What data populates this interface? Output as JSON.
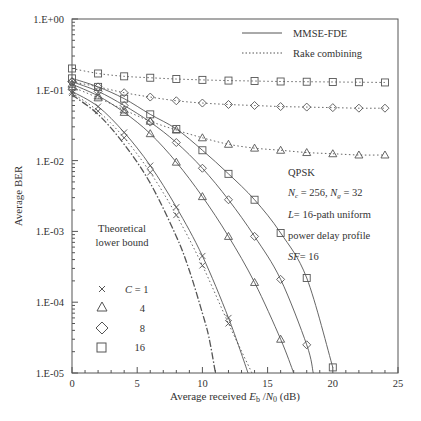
{
  "chart_data": {
    "type": "line",
    "title": "",
    "xlabel": "Average received Eb/N0 (dB)",
    "ylabel": "Average BER",
    "xlim": [
      0,
      25
    ],
    "ylim": [
      1e-05,
      1
    ],
    "yscale": "log",
    "x_ticks": [
      0,
      5,
      10,
      15,
      20,
      25
    ],
    "y_ticks": [
      "1.E+00",
      "1.E-01",
      "1.E-02",
      "1.E-03",
      "1.E-04",
      "1.E-05"
    ],
    "grid": false,
    "legend": {
      "position": "upper-right",
      "entries": [
        {
          "label": "MMSE-FDE",
          "style": "solid"
        },
        {
          "label": "Rake combining",
          "style": "dotted"
        }
      ]
    },
    "marker_legend": {
      "position": "lower-left",
      "entries": [
        {
          "marker": "x",
          "label": "C = 1"
        },
        {
          "marker": "triangle",
          "label": "4"
        },
        {
          "marker": "diamond",
          "label": "8"
        },
        {
          "marker": "square",
          "label": "16"
        }
      ]
    },
    "annotations": [
      "QPSK",
      "Nc = 256, Ng = 32",
      "L = 16-path uniform",
      "power delay profile",
      "SF = 16",
      "Theoretical lower bound"
    ],
    "series": [
      {
        "name": "Theoretical lower bound",
        "style": "dashdot",
        "marker": "none",
        "x": [
          0,
          2,
          4,
          6,
          8,
          9,
          10,
          10.5,
          11
        ],
        "y": [
          0.085,
          0.045,
          0.017,
          0.0048,
          0.00085,
          0.00028,
          7e-05,
          3.2e-05,
          1e-05
        ]
      },
      {
        "name": "MMSE-FDE C=1",
        "style": "solid",
        "marker": "x",
        "x": [
          0,
          2,
          4,
          6,
          8,
          10,
          12,
          13.5
        ],
        "y": [
          0.095,
          0.058,
          0.025,
          0.0085,
          0.0022,
          0.00045,
          6e-05,
          1e-05
        ]
      },
      {
        "name": "Rake C=1",
        "style": "dotted",
        "marker": "x",
        "x": [
          0,
          2,
          4,
          6,
          8,
          10,
          12,
          13.8
        ],
        "y": [
          0.09,
          0.05,
          0.021,
          0.0068,
          0.0017,
          0.00033,
          5e-05,
          1e-05
        ]
      },
      {
        "name": "MMSE-FDE C=4",
        "style": "solid",
        "marker": "triangle",
        "x": [
          0,
          2,
          4,
          6,
          8,
          10,
          12,
          14,
          16,
          17
        ],
        "y": [
          0.12,
          0.082,
          0.048,
          0.024,
          0.0095,
          0.0031,
          0.00085,
          0.00019,
          3e-05,
          1e-05
        ]
      },
      {
        "name": "Rake C=4",
        "style": "dotted",
        "marker": "triangle",
        "x": [
          0,
          2,
          4,
          6,
          8,
          10,
          12,
          14,
          16,
          18,
          20,
          22,
          24
        ],
        "y": [
          0.11,
          0.077,
          0.052,
          0.036,
          0.027,
          0.021,
          0.017,
          0.015,
          0.014,
          0.013,
          0.0125,
          0.012,
          0.012
        ]
      },
      {
        "name": "MMSE-FDE C=8",
        "style": "solid",
        "marker": "diamond",
        "x": [
          0,
          2,
          4,
          6,
          8,
          10,
          12,
          14,
          16,
          18,
          18.5
        ],
        "y": [
          0.13,
          0.095,
          0.06,
          0.035,
          0.018,
          0.0078,
          0.0028,
          0.00085,
          0.00021,
          2.5e-05,
          1e-05
        ]
      },
      {
        "name": "Rake C=8",
        "style": "dotted",
        "marker": "diamond",
        "x": [
          0,
          2,
          4,
          6,
          8,
          10,
          12,
          14,
          16,
          18,
          20,
          22,
          24
        ],
        "y": [
          0.13,
          0.11,
          0.091,
          0.079,
          0.07,
          0.065,
          0.062,
          0.06,
          0.058,
          0.057,
          0.056,
          0.055,
          0.055
        ]
      },
      {
        "name": "MMSE-FDE C=16",
        "style": "solid",
        "marker": "square",
        "x": [
          0,
          2,
          4,
          6,
          8,
          10,
          12,
          14,
          16,
          18,
          20
        ],
        "y": [
          0.145,
          0.11,
          0.075,
          0.045,
          0.028,
          0.014,
          0.0065,
          0.0028,
          0.00095,
          0.00022,
          1.2e-05
        ]
      },
      {
        "name": "Rake C=16",
        "style": "dotted",
        "marker": "square",
        "x": [
          0,
          2,
          4,
          6,
          8,
          10,
          12,
          14,
          16,
          18,
          20,
          22,
          24
        ],
        "y": [
          0.2,
          0.17,
          0.155,
          0.148,
          0.142,
          0.138,
          0.135,
          0.133,
          0.131,
          0.13,
          0.129,
          0.128,
          0.127
        ]
      }
    ]
  },
  "labels": {
    "ylabel": "Average BER",
    "xlabel_pre": "Average received ",
    "xlabel_eb": "E",
    "xlabel_b": "b",
    "xlabel_slash": " /",
    "xlabel_n": "N",
    "xlabel_0": "0",
    "xlabel_post": " (dB)",
    "legend_solid": "MMSE-FDE",
    "legend_dotted": "Rake combining",
    "ann_qpsk": "QPSK",
    "ann_nc": "256",
    "ann_ng": "32",
    "ann_l": "= 16-path uniform",
    "ann_pdp": "power delay profile",
    "ann_sf": "= 16",
    "ann_theory_1": "Theoretical",
    "ann_theory_2": "lower bound",
    "ml_c1": "C = 1",
    "ml_4": "4",
    "ml_8": "8",
    "ml_16": "16"
  }
}
